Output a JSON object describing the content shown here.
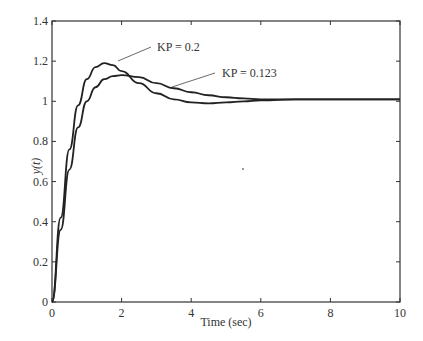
{
  "chart_data": {
    "type": "line",
    "title": "",
    "xlabel": "Time (sec)",
    "ylabel": "y(t)",
    "xlim": [
      0,
      10
    ],
    "ylim": [
      0,
      1.4
    ],
    "grid": false,
    "xticks": [
      "0",
      "2",
      "4",
      "6",
      "8",
      "10"
    ],
    "yticks": [
      "0",
      "0.2",
      "0.4",
      "0.6",
      "0.8",
      "1",
      "1.2",
      "1.4"
    ],
    "series": [
      {
        "name": "KP = 0.2",
        "x": [
          0,
          0.25,
          0.5,
          0.75,
          1.0,
          1.25,
          1.5,
          1.75,
          2.0,
          2.5,
          3.0,
          3.5,
          4.0,
          4.5,
          5.0,
          5.5,
          6.0,
          7.0,
          8.0,
          9.0,
          10.0
        ],
        "y": [
          0,
          0.42,
          0.76,
          0.98,
          1.11,
          1.17,
          1.19,
          1.18,
          1.15,
          1.09,
          1.04,
          1.01,
          0.995,
          0.99,
          0.995,
          1.0,
          1.005,
          1.01,
          1.01,
          1.01,
          1.01
        ]
      },
      {
        "name": "KP = 0.123",
        "x": [
          0,
          0.25,
          0.5,
          0.75,
          1.0,
          1.25,
          1.5,
          1.75,
          2.0,
          2.5,
          3.0,
          3.5,
          4.0,
          4.5,
          5.0,
          5.5,
          6.0,
          7.0,
          8.0,
          9.0,
          10.0
        ],
        "y": [
          0,
          0.36,
          0.66,
          0.87,
          1.0,
          1.07,
          1.11,
          1.125,
          1.13,
          1.12,
          1.09,
          1.065,
          1.045,
          1.03,
          1.02,
          1.015,
          1.01,
          1.01,
          1.01,
          1.01,
          1.01
        ]
      }
    ],
    "annotations": [
      {
        "text": "KP = 0.2",
        "points_to": "KP = 0.2"
      },
      {
        "text": "KP = 0.123",
        "points_to": "KP = 0.123"
      }
    ]
  }
}
